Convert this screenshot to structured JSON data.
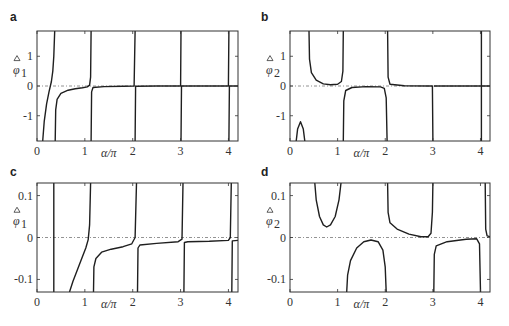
{
  "figure": {
    "panels": [
      {
        "id": "a",
        "label": "a"
      },
      {
        "id": "b",
        "label": "b"
      },
      {
        "id": "c",
        "label": "c"
      },
      {
        "id": "d",
        "label": "d"
      }
    ]
  },
  "chart_data": [
    {
      "panel": "a",
      "type": "line",
      "title": "",
      "xlabel": "α/π",
      "ylabel": "φ̂1",
      "xlim": [
        0,
        4.2
      ],
      "ylim": [
        -1.85,
        1.85
      ],
      "xticks": [
        0,
        1,
        2,
        3,
        4
      ],
      "yticks": [
        -1,
        0,
        1
      ],
      "grid": false,
      "reference_line": {
        "y": 0,
        "style": "dash-dot"
      },
      "series": [
        {
          "name": "branch-1",
          "points": [
            [
              0.12,
              -1.85
            ],
            [
              0.15,
              -1.2
            ],
            [
              0.2,
              -0.6
            ],
            [
              0.25,
              -0.2
            ],
            [
              0.3,
              0.15
            ],
            [
              0.33,
              0.5
            ],
            [
              0.35,
              1.0
            ],
            [
              0.37,
              1.85
            ]
          ]
        },
        {
          "name": "branch-2",
          "points": [
            [
              0.38,
              -1.85
            ],
            [
              0.39,
              -0.8
            ],
            [
              0.42,
              -0.45
            ],
            [
              0.5,
              -0.25
            ],
            [
              0.65,
              -0.14
            ],
            [
              0.8,
              -0.09
            ],
            [
              0.95,
              -0.06
            ],
            [
              1.05,
              -0.03
            ],
            [
              1.1,
              0.03
            ],
            [
              1.12,
              0.3
            ],
            [
              1.13,
              1.85
            ]
          ]
        },
        {
          "name": "branch-3",
          "points": [
            [
              1.13,
              -1.85
            ],
            [
              1.14,
              -0.2
            ],
            [
              1.17,
              -0.05
            ],
            [
              1.4,
              -0.02
            ],
            [
              1.8,
              -0.01
            ],
            [
              2.03,
              0.0
            ],
            [
              2.05,
              1.85
            ]
          ]
        },
        {
          "name": "branch-4",
          "points": [
            [
              2.05,
              -1.85
            ],
            [
              2.06,
              -0.01
            ],
            [
              2.5,
              0.0
            ],
            [
              3.0,
              0.0
            ],
            [
              3.01,
              1.85
            ]
          ]
        },
        {
          "name": "branch-5",
          "points": [
            [
              3.01,
              -1.85
            ],
            [
              3.02,
              0.0
            ],
            [
              3.5,
              0.0
            ],
            [
              4.0,
              0.0
            ],
            [
              4.01,
              1.85
            ]
          ]
        },
        {
          "name": "branch-6",
          "points": [
            [
              4.01,
              -1.85
            ],
            [
              4.02,
              0.0
            ],
            [
              4.2,
              0.0
            ]
          ]
        }
      ]
    },
    {
      "panel": "b",
      "type": "line",
      "title": "",
      "xlabel": "α/π",
      "ylabel": "φ̂2",
      "xlim": [
        0,
        4.2
      ],
      "ylim": [
        -1.85,
        1.85
      ],
      "xticks": [
        0,
        1,
        2,
        3,
        4
      ],
      "yticks": [
        -1,
        0,
        1
      ],
      "grid": false,
      "reference_line": {
        "y": 0,
        "style": "dash-dot"
      },
      "series": [
        {
          "name": "branch-1",
          "points": [
            [
              0.13,
              -1.85
            ],
            [
              0.16,
              -1.45
            ],
            [
              0.22,
              -1.2
            ],
            [
              0.28,
              -1.45
            ],
            [
              0.31,
              -1.85
            ]
          ]
        },
        {
          "name": "branch-2",
          "points": [
            [
              0.4,
              1.85
            ],
            [
              0.41,
              0.9
            ],
            [
              0.45,
              0.45
            ],
            [
              0.55,
              0.2
            ],
            [
              0.7,
              0.07
            ],
            [
              0.85,
              0.04
            ],
            [
              1.0,
              0.06
            ],
            [
              1.08,
              0.15
            ],
            [
              1.11,
              0.5
            ],
            [
              1.12,
              1.85
            ]
          ]
        },
        {
          "name": "branch-3",
          "points": [
            [
              1.12,
              -1.85
            ],
            [
              1.13,
              -0.5
            ],
            [
              1.17,
              -0.15
            ],
            [
              1.3,
              -0.05
            ],
            [
              1.6,
              -0.02
            ],
            [
              1.9,
              -0.03
            ],
            [
              1.98,
              -0.08
            ],
            [
              2.02,
              -0.4
            ],
            [
              2.04,
              -1.85
            ]
          ]
        },
        {
          "name": "branch-4",
          "points": [
            [
              2.05,
              1.85
            ],
            [
              2.06,
              0.3
            ],
            [
              2.1,
              0.06
            ],
            [
              2.4,
              0.01
            ],
            [
              2.9,
              0.0
            ],
            [
              2.99,
              0.0
            ],
            [
              3.0,
              -1.85
            ]
          ]
        },
        {
          "name": "branch-5",
          "points": [
            [
              4.02,
              1.85
            ],
            [
              4.02,
              -1.85
            ]
          ]
        },
        {
          "name": "branch-6",
          "points": [
            [
              3.02,
              0.0
            ],
            [
              4.2,
              0.0
            ]
          ]
        }
      ]
    },
    {
      "panel": "c",
      "type": "line",
      "title": "",
      "xlabel": "α/π",
      "ylabel": "φ̂1",
      "xlim": [
        0,
        4.2
      ],
      "ylim": [
        -0.13,
        0.13
      ],
      "xticks": [
        0,
        1,
        2,
        3,
        4
      ],
      "yticks": [
        -0.1,
        0,
        0.1
      ],
      "grid": false,
      "reference_line": {
        "y": 0,
        "style": "dash-dot"
      },
      "series": [
        {
          "name": "branch-1",
          "points": [
            [
              0.35,
              -0.13
            ],
            [
              0.35,
              0.13
            ]
          ]
        },
        {
          "name": "branch-2",
          "points": [
            [
              0.68,
              -0.13
            ],
            [
              0.75,
              -0.105
            ],
            [
              0.85,
              -0.075
            ],
            [
              0.95,
              -0.045
            ],
            [
              1.02,
              -0.025
            ],
            [
              1.07,
              -0.005
            ],
            [
              1.1,
              0.03
            ],
            [
              1.12,
              0.13
            ]
          ]
        },
        {
          "name": "branch-3",
          "points": [
            [
              1.18,
              -0.13
            ],
            [
              1.19,
              -0.07
            ],
            [
              1.23,
              -0.05
            ],
            [
              1.35,
              -0.035
            ],
            [
              1.55,
              -0.028
            ],
            [
              1.8,
              -0.022
            ],
            [
              1.98,
              -0.015
            ],
            [
              2.05,
              0.0
            ],
            [
              2.08,
              0.13
            ]
          ]
        },
        {
          "name": "branch-4",
          "points": [
            [
              2.1,
              -0.13
            ],
            [
              2.11,
              -0.025
            ],
            [
              2.15,
              -0.018
            ],
            [
              2.5,
              -0.014
            ],
            [
              2.95,
              -0.01
            ],
            [
              3.03,
              -0.004
            ],
            [
              3.05,
              0.13
            ]
          ]
        },
        {
          "name": "branch-5",
          "points": [
            [
              3.07,
              -0.13
            ],
            [
              3.08,
              -0.012
            ],
            [
              3.15,
              -0.01
            ],
            [
              3.6,
              -0.009
            ],
            [
              4.0,
              -0.007
            ],
            [
              4.04,
              0.0
            ],
            [
              4.06,
              0.13
            ]
          ]
        },
        {
          "name": "branch-6",
          "points": [
            [
              4.07,
              -0.13
            ],
            [
              4.08,
              -0.008
            ],
            [
              4.2,
              -0.007
            ]
          ]
        }
      ]
    },
    {
      "panel": "d",
      "type": "line",
      "title": "",
      "xlabel": "α/π",
      "ylabel": "φ̂2",
      "xlim": [
        0,
        4.2
      ],
      "ylim": [
        -0.13,
        0.13
      ],
      "xticks": [
        0,
        1,
        2,
        3,
        4
      ],
      "yticks": [
        -0.1,
        0,
        0.1
      ],
      "grid": false,
      "reference_line": {
        "y": 0,
        "style": "dash-dot"
      },
      "series": [
        {
          "name": "branch-1",
          "points": [
            [
              0.52,
              0.13
            ],
            [
              0.55,
              0.09
            ],
            [
              0.62,
              0.05
            ],
            [
              0.7,
              0.03
            ],
            [
              0.77,
              0.025
            ],
            [
              0.85,
              0.03
            ],
            [
              0.95,
              0.05
            ],
            [
              1.03,
              0.09
            ],
            [
              1.07,
              0.13
            ]
          ]
        },
        {
          "name": "branch-2",
          "points": [
            [
              1.19,
              -0.13
            ],
            [
              1.21,
              -0.09
            ],
            [
              1.27,
              -0.055
            ],
            [
              1.4,
              -0.025
            ],
            [
              1.55,
              -0.01
            ],
            [
              1.7,
              -0.006
            ],
            [
              1.85,
              -0.01
            ],
            [
              1.95,
              -0.03
            ],
            [
              2.0,
              -0.07
            ],
            [
              2.02,
              -0.13
            ]
          ]
        },
        {
          "name": "branch-3",
          "points": [
            [
              2.05,
              0.13
            ],
            [
              2.06,
              0.06
            ],
            [
              2.1,
              0.035
            ],
            [
              2.25,
              0.02
            ],
            [
              2.5,
              0.008
            ],
            [
              2.75,
              0.002
            ],
            [
              2.9,
              0.002
            ],
            [
              2.96,
              0.01
            ],
            [
              2.99,
              0.06
            ],
            [
              3.0,
              0.13
            ]
          ]
        },
        {
          "name": "branch-4",
          "points": [
            [
              3.02,
              -0.13
            ],
            [
              3.03,
              -0.04
            ],
            [
              3.07,
              -0.02
            ],
            [
              3.3,
              -0.01
            ],
            [
              3.7,
              -0.004
            ],
            [
              3.92,
              -0.003
            ],
            [
              3.98,
              -0.015
            ],
            [
              4.0,
              -0.13
            ]
          ]
        },
        {
          "name": "branch-5",
          "points": [
            [
              4.1,
              0.13
            ],
            [
              4.11,
              0.02
            ],
            [
              4.14,
              0.004
            ],
            [
              4.2,
              0.002
            ]
          ]
        }
      ]
    }
  ],
  "colors": {
    "curve": "#1f1f1f",
    "axis": "#333333",
    "reference": "#777777",
    "background": "#ffffff"
  }
}
